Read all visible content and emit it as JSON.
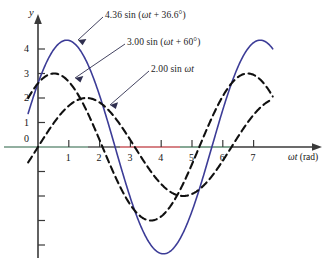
{
  "chart_data": {
    "type": "line",
    "title": "",
    "xlabel": "ωt (rad)",
    "ylabel": "y",
    "xlim": [
      -0.55,
      8.1
    ],
    "ylim": [
      -5.2,
      4.9
    ],
    "xticks": [
      1,
      2,
      3,
      4,
      5,
      6,
      7
    ],
    "xtick_labels": [
      "1",
      "2",
      "3",
      "4",
      "5",
      "6",
      "7"
    ],
    "yticks": [
      0,
      1,
      2,
      3,
      4
    ],
    "ytick_labels": [
      "0",
      "1",
      "2",
      "3",
      "4"
    ],
    "yticks_unlabeled": [
      -1,
      -2,
      -3,
      -4
    ],
    "grid": false,
    "legend": "inline-annotations",
    "series": [
      {
        "name": "4.36 sin (ωt + 36.6°)",
        "label_html": "4.36 sin (<i>ωt</i> + 36.6°)",
        "amplitude": 4.36,
        "phase_deg": 36.6,
        "style": "solid",
        "color": "#3c3c97",
        "linewidth": 1.6,
        "peak": {
          "x": 0.89,
          "y": 4.36
        },
        "trough": {
          "x": 4.03,
          "y": -4.36
        },
        "y_at_zero": 2.6
      },
      {
        "name": "3.00 sin (ωt + 60°)",
        "label_html": "3.00 sin (<i>ωt</i> + 60°)",
        "amplitude": 3.0,
        "phase_deg": 60,
        "style": "dashed",
        "color": "#101010",
        "linewidth": 2.1,
        "peak": {
          "x": 0.52,
          "y": 3.0
        },
        "trough": {
          "x": 3.67,
          "y": -3.0
        },
        "y_at_zero": 2.6
      },
      {
        "name": "2.00 sin ωt",
        "label_html": "2.00 sin <i>ωt</i>",
        "amplitude": 2.0,
        "phase_deg": 0,
        "style": "dashed",
        "color": "#101010",
        "linewidth": 2.1,
        "peak": {
          "x": 1.57,
          "y": 2.0
        },
        "trough": {
          "x": 4.71,
          "y": -2.0
        },
        "y_at_zero": 0.0
      }
    ],
    "x_domain_drawn": [
      -0.32,
      7.62
    ],
    "annotations": [
      {
        "text": "4.36 sin (ωt + 36.6°)",
        "points_to_series": 0
      },
      {
        "text": "3.00 sin (ωt + 60°)",
        "points_to_series": 1
      },
      {
        "text": "2.00 sin ωt",
        "points_to_series": 2
      }
    ]
  },
  "labels": {
    "curve1": "4.36 sin (",
    "curve1_arg": "ωt",
    "curve1_tail": " + 36.6°)",
    "curve2": "3.00 sin (",
    "curve2_arg": "ωt",
    "curve2_tail": " + 60°)",
    "curve3": "2.00 sin ",
    "curve3_arg": "ωt",
    "y_axis": "y",
    "x_axis_sym": "ωt",
    "x_axis_unit": " (rad)",
    "ticks_x": [
      "1",
      "2",
      "3",
      "4",
      "5",
      "6",
      "7"
    ],
    "ticks_y": [
      "0",
      "1",
      "2",
      "3",
      "4"
    ]
  },
  "colors": {
    "curve_solid": "#3c3c97",
    "curve_dashed": "#101010",
    "axis": "#3a3a3a",
    "axis_tint_left": "#5d8a70",
    "axis_tint_mid": "#c9585e",
    "leader": "#2f2f4f",
    "background": "#ffffff"
  }
}
